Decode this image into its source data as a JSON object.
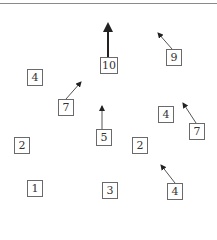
{
  "diagram": {
    "nodes": [
      {
        "id": "n10",
        "label": "10",
        "x": 100,
        "y": 57,
        "arrow": {
          "to": [
            108,
            22
          ],
          "weight": "bold"
        }
      },
      {
        "id": "n9",
        "label": "9",
        "x": 166,
        "y": 49,
        "arrow": {
          "to": [
            156,
            31
          ],
          "weight": "normal"
        }
      },
      {
        "id": "n4a",
        "label": "4",
        "x": 27,
        "y": 69,
        "arrow": null
      },
      {
        "id": "n7a",
        "label": "7",
        "x": 58,
        "y": 99,
        "arrow": {
          "to": [
            83,
            80
          ],
          "weight": "normal"
        }
      },
      {
        "id": "n5",
        "label": "5",
        "x": 96,
        "y": 129,
        "arrow": {
          "to": [
            102,
            104
          ],
          "weight": "normal"
        }
      },
      {
        "id": "n4b",
        "label": "4",
        "x": 158,
        "y": 106,
        "arrow": null
      },
      {
        "id": "n7b",
        "label": "7",
        "x": 189,
        "y": 123,
        "arrow": {
          "to": [
            182,
            101
          ],
          "weight": "normal"
        }
      },
      {
        "id": "n2a",
        "label": "2",
        "x": 14,
        "y": 137,
        "arrow": null
      },
      {
        "id": "n2b",
        "label": "2",
        "x": 132,
        "y": 137,
        "arrow": null
      },
      {
        "id": "n1",
        "label": "1",
        "x": 27,
        "y": 180,
        "arrow": null
      },
      {
        "id": "n3",
        "label": "3",
        "x": 102,
        "y": 182,
        "arrow": null
      },
      {
        "id": "n4c",
        "label": "4",
        "x": 167,
        "y": 183,
        "arrow": {
          "to": [
            160,
            163
          ],
          "weight": "normal"
        }
      }
    ]
  }
}
